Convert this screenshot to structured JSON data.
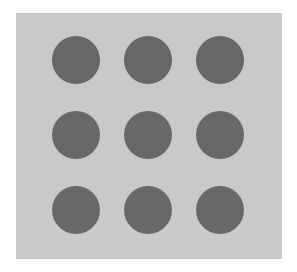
{
  "canvas": {
    "background": "#ffffff",
    "panel_color": "#c9c9c9",
    "dot_color": "#686868"
  },
  "grid": {
    "rows": 3,
    "columns": 3,
    "dots": [
      {
        "row": 1,
        "col": 1,
        "cx": 76,
        "cy": 60
      },
      {
        "row": 1,
        "col": 2,
        "cx": 148,
        "cy": 60
      },
      {
        "row": 1,
        "col": 3,
        "cx": 220,
        "cy": 60
      },
      {
        "row": 2,
        "col": 1,
        "cx": 76,
        "cy": 135
      },
      {
        "row": 2,
        "col": 2,
        "cx": 148,
        "cy": 135
      },
      {
        "row": 2,
        "col": 3,
        "cx": 220,
        "cy": 135
      },
      {
        "row": 3,
        "col": 1,
        "cx": 76,
        "cy": 210
      },
      {
        "row": 3,
        "col": 2,
        "cx": 148,
        "cy": 210
      },
      {
        "row": 3,
        "col": 3,
        "cx": 220,
        "cy": 210
      }
    ]
  }
}
